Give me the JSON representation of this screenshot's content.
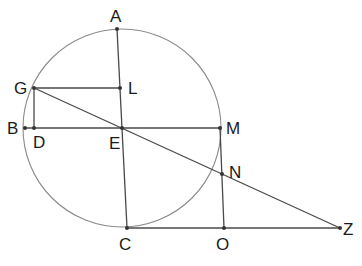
{
  "diagram": {
    "type": "geometry",
    "circle": {
      "center": "E",
      "cx": 122,
      "cy": 128,
      "r": 99
    },
    "points": [
      {
        "name": "A",
        "x": 117,
        "y": 29,
        "label": "A",
        "lx": 110,
        "ly": 22
      },
      {
        "name": "L",
        "x": 120,
        "y": 88,
        "label": "L",
        "lx": 128,
        "ly": 94
      },
      {
        "name": "G",
        "x": 34,
        "y": 88,
        "label": "G",
        "lx": 14,
        "ly": 94
      },
      {
        "name": "B",
        "x": 25,
        "y": 128,
        "label": "B",
        "lx": 7,
        "ly": 134
      },
      {
        "name": "D",
        "x": 34,
        "y": 128,
        "label": "D",
        "lx": 33,
        "ly": 148
      },
      {
        "name": "E",
        "x": 122,
        "y": 128,
        "label": "E",
        "lx": 109,
        "ly": 149
      },
      {
        "name": "M",
        "x": 220,
        "y": 128,
        "label": "M",
        "lx": 226,
        "ly": 134
      },
      {
        "name": "N",
        "x": 222,
        "y": 174,
        "label": "N",
        "lx": 229,
        "ly": 178
      },
      {
        "name": "C",
        "x": 127,
        "y": 228,
        "label": "C",
        "lx": 119,
        "ly": 250
      },
      {
        "name": "O",
        "x": 224,
        "y": 228,
        "label": "O",
        "lx": 216,
        "ly": 250
      },
      {
        "name": "Z",
        "x": 340,
        "y": 228,
        "label": "Z",
        "lx": 343,
        "ly": 235
      }
    ],
    "segments": [
      [
        "A",
        "C"
      ],
      [
        "G",
        "L"
      ],
      [
        "B",
        "M"
      ],
      [
        "G",
        "D"
      ],
      [
        "G",
        "Z"
      ],
      [
        "C",
        "Z"
      ],
      [
        "M",
        "O"
      ]
    ]
  }
}
